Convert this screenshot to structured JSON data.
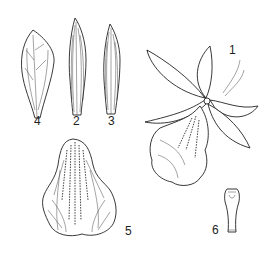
{
  "figure": {
    "type": "botanical-illustration",
    "colors": {
      "ink": "#222222",
      "background": "#ffffff"
    },
    "labels": [
      {
        "id": "1",
        "text": "1",
        "part": "whole flower",
        "x": 229,
        "y": 44
      },
      {
        "id": "2",
        "text": "2",
        "part": "dorsal sepal",
        "x": 73,
        "y": 115
      },
      {
        "id": "3",
        "text": "3",
        "part": "lateral sepal",
        "x": 108,
        "y": 115
      },
      {
        "id": "4",
        "text": "4",
        "part": "petal",
        "x": 34,
        "y": 115
      },
      {
        "id": "5",
        "text": "5",
        "part": "lip (labellum)",
        "x": 125,
        "y": 225
      },
      {
        "id": "6",
        "text": "6",
        "part": "column",
        "x": 212,
        "y": 224
      }
    ]
  }
}
